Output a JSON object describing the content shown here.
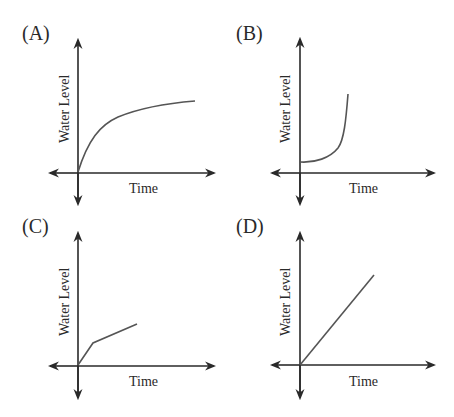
{
  "figure": {
    "panels": [
      {
        "id": "A",
        "label": "(A)",
        "x_label": "Time",
        "y_label": "Water Level",
        "curve_shape": "concave-down increasing (logarithmic-like)"
      },
      {
        "id": "B",
        "label": "(B)",
        "x_label": "Time",
        "y_label": "Water Level",
        "curve_shape": "starts above zero, slow then steep increase (exponential-like)"
      },
      {
        "id": "C",
        "label": "(C)",
        "x_label": "Time",
        "y_label": "Water Level",
        "curve_shape": "piecewise linear: steep then shallower slope"
      },
      {
        "id": "D",
        "label": "(D)",
        "x_label": "Time",
        "y_label": "Water Level",
        "curve_shape": "linear increasing from origin"
      }
    ]
  },
  "colors": {
    "axis": "#2a2a2a",
    "curve": "#555555",
    "text": "#2a2a2a"
  }
}
